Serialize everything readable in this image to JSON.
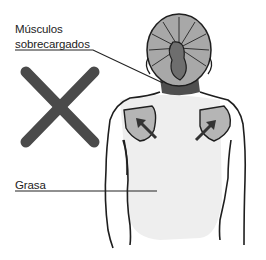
{
  "labels": {
    "muscles_line1": "Músculos",
    "muscles_line2": "sobrecargados",
    "fat": "Grasa"
  },
  "icons": {
    "wrong_mark": "x-mark-icon",
    "arrows": "arrow-up-icon"
  },
  "colors": {
    "x_mark": "#4a4a4a",
    "hair": "#a8a8a8",
    "collar": "#4f4f4f",
    "shoulder_patch": "#b5b5b5",
    "back_fill": "#eeeeee",
    "outline": "#1e1e1e"
  }
}
